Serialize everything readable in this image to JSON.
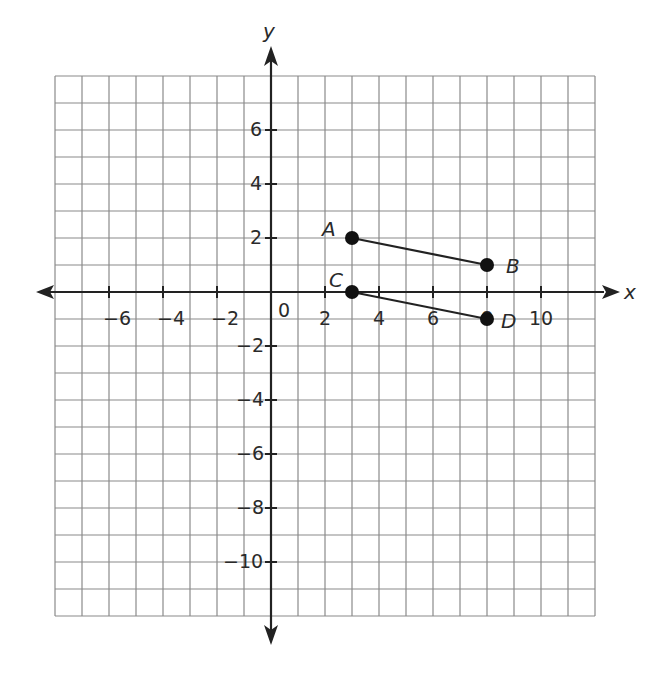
{
  "chart_data": {
    "type": "scatter",
    "title": "",
    "xlabel": "x",
    "ylabel": "y",
    "xlim": [
      -8,
      12
    ],
    "ylim": [
      -12,
      8
    ],
    "grid": true,
    "grid_step": 1,
    "x_ticks": [
      -6,
      -4,
      -2,
      0,
      2,
      4,
      6,
      8,
      10
    ],
    "y_ticks": [
      6,
      4,
      2,
      -2,
      -4,
      -6,
      -8,
      -10
    ],
    "x_tick_labels": [
      "−6",
      "−4",
      "−2",
      "0",
      "2",
      "4",
      "6",
      "8",
      "10"
    ],
    "y_tick_labels": [
      "6",
      "4",
      "2",
      "−2",
      "−4",
      "−6",
      "−8",
      "−10"
    ],
    "points": [
      {
        "label": "A",
        "x": 3,
        "y": 2
      },
      {
        "label": "B",
        "x": 8,
        "y": 1
      },
      {
        "label": "C",
        "x": 3,
        "y": 0
      },
      {
        "label": "D",
        "x": 8,
        "y": -1
      }
    ],
    "segments": [
      {
        "from": "A",
        "to": "B"
      },
      {
        "from": "C",
        "to": "D"
      }
    ],
    "colors": {
      "grid": "#8a8a8a",
      "axis": "#222222",
      "point": "#111111"
    }
  },
  "labels": {
    "x_axis": "x",
    "y_axis": "y",
    "origin": "0",
    "point_a": "A",
    "point_b": "B",
    "point_c": "C",
    "point_d": "D",
    "xt_m6": "−6",
    "xt_m4": "−4",
    "xt_m2": "−2",
    "xt_2": "2",
    "xt_4": "4",
    "xt_6": "6",
    "xt_8": "8",
    "xt_10": "10",
    "yt_6": "6",
    "yt_4": "4",
    "yt_2": "2",
    "yt_m2": "−2",
    "yt_m4": "−4",
    "yt_m6": "−6",
    "yt_m8": "−8",
    "yt_m10": "−10"
  }
}
